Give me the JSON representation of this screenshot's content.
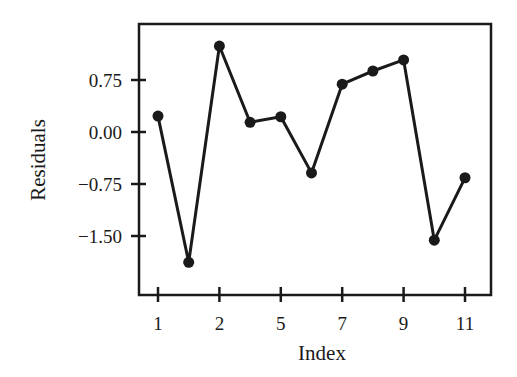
{
  "chart_data": {
    "type": "line",
    "title": "",
    "xlabel": "Index",
    "ylabel": "Residuals",
    "x_tick_labels": [
      "1",
      "2",
      "5",
      "7",
      "9",
      "11"
    ],
    "x_tick_positions": [
      1,
      3,
      5,
      7,
      9,
      11
    ],
    "y_tick_labels": [
      "0.75",
      "0.00",
      "−0.75",
      "−1.50"
    ],
    "y_tick_values": [
      0.75,
      0.0,
      -0.75,
      -1.5
    ],
    "x": [
      1,
      2,
      3,
      4,
      5,
      6,
      7,
      8,
      9,
      10,
      11
    ],
    "series": [
      {
        "name": "Residuals",
        "values": [
          0.23,
          -1.88,
          1.24,
          0.14,
          0.22,
          -0.59,
          0.69,
          0.88,
          1.04,
          -1.56,
          -0.66
        ],
        "color": "#1a1a1a",
        "marker": "circle"
      }
    ],
    "xlim": [
      0.2,
      12.1
    ],
    "ylim": [
      -2.35,
      1.58
    ],
    "grid": false,
    "legend": "none"
  }
}
